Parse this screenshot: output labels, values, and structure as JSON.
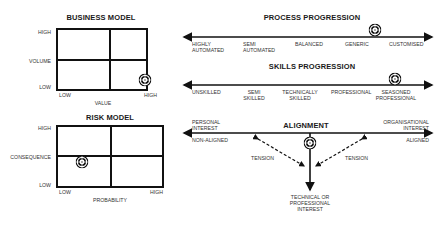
{
  "business_model": {
    "title": "BUSINESS MODEL",
    "y_axis": {
      "label": "VOLUME",
      "high": "HIGH",
      "low": "LOW"
    },
    "x_axis": {
      "label": "VALUE",
      "low": "LOW",
      "high": "HIGH"
    },
    "marker": {
      "quadrant": "low-volume / high-value"
    }
  },
  "risk_model": {
    "title": "RISK MODEL",
    "y_axis": {
      "label": "CONSEQUENCE",
      "high": "HIGH",
      "low": "LOW"
    },
    "x_axis": {
      "label": "PROBABILITY",
      "low": "LOW",
      "high": "HIGH"
    },
    "marker": {
      "quadrant": "low-consequence / low-probability"
    }
  },
  "process_progression": {
    "title": "PROCESS PROGRESSION",
    "stages": [
      {
        "line1": "HIGHLY",
        "line2": "AUTOMATED"
      },
      {
        "line1": "SEMI",
        "line2": "AUTOMATED"
      },
      {
        "line1": "BALANCED",
        "line2": ""
      },
      {
        "line1": "GENERIC",
        "line2": ""
      },
      {
        "line1": "CUSTOMISED",
        "line2": ""
      }
    ],
    "marker_stage": "GENERIC"
  },
  "skills_progression": {
    "title": "SKILLS PROGRESSION",
    "stages": [
      {
        "line1": "UNSKILLED",
        "line2": ""
      },
      {
        "line1": "SEMI",
        "line2": "SKILLED"
      },
      {
        "line1": "TECHNICALLY",
        "line2": "SKILLED"
      },
      {
        "line1": "PROFESSIONAL",
        "line2": ""
      },
      {
        "line1": "SEASONED",
        "line2": "PROFESSIONAL"
      }
    ],
    "marker_stage": "SEASONED PROFESSIONAL"
  },
  "alignment": {
    "title": "ALIGNMENT",
    "left_top": {
      "line1": "PERSONAL",
      "line2": "INTEREST"
    },
    "left_bottom": "NON-ALIGNED",
    "right_top": {
      "line1": "ORGANISATIONAL",
      "line2": "INTEREST"
    },
    "right_bottom": "ALIGNED",
    "tension_left": "TENSION",
    "tension_right": "TENSION",
    "bottom": {
      "line1": "TECHNICAL OR",
      "line2": "PROFESSIONAL",
      "line3": "INTEREST"
    },
    "marker": "center"
  }
}
